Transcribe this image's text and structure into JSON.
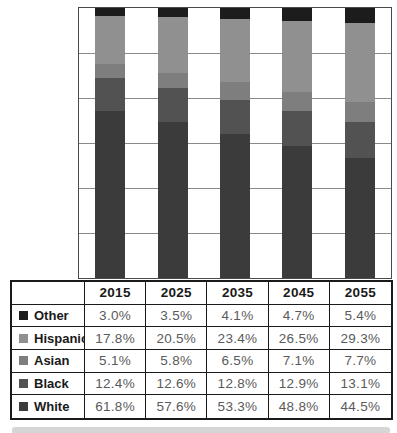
{
  "chart_data": {
    "type": "bar",
    "variant": "stacked-100-percent",
    "categories": [
      "2015",
      "2025",
      "2035",
      "2045",
      "2055"
    ],
    "series": [
      {
        "name": "Other",
        "color": "#1c1c1c",
        "values": [
          3.0,
          3.5,
          4.1,
          4.7,
          5.4
        ]
      },
      {
        "name": "Hispanic",
        "color": "#909090",
        "values": [
          17.8,
          20.5,
          23.4,
          26.5,
          29.3
        ]
      },
      {
        "name": "Asian",
        "color": "#7e7e7e",
        "values": [
          5.1,
          5.8,
          6.5,
          7.1,
          7.7
        ]
      },
      {
        "name": "Black",
        "color": "#525252",
        "values": [
          12.4,
          12.6,
          12.8,
          12.9,
          13.1
        ]
      },
      {
        "name": "White",
        "color": "#3b3b3b",
        "values": [
          61.8,
          57.6,
          53.3,
          48.8,
          44.5
        ]
      }
    ],
    "stack_order_top_to_bottom": [
      "Other",
      "Hispanic",
      "Asian",
      "Black",
      "White"
    ],
    "value_suffix": "%",
    "value_decimals": 1,
    "title": "",
    "xlabel": "",
    "ylabel": "",
    "ylim": [
      0,
      100
    ],
    "grid": {
      "horizontal_divisions": 6,
      "on": true
    },
    "legend_position": "table-row-labels"
  },
  "table": {
    "corner_label": "",
    "column_headers": [
      "2015",
      "2025",
      "2035",
      "2045",
      "2055"
    ],
    "row_labels": [
      "Other",
      "Hispanic",
      "Asian",
      "Black",
      "White"
    ]
  },
  "colors": {
    "chart_border": "#4a4a4a",
    "gridline": "#8a8a8a",
    "table_border": "#1a1a1a",
    "value_text": "#5a5a5a",
    "bottom_strip": "#d6d6d6",
    "background": "#ffffff"
  }
}
